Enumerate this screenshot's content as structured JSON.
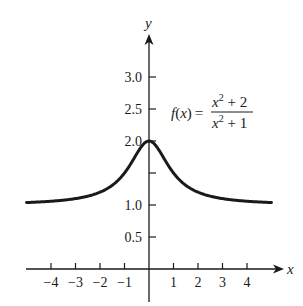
{
  "chart_data": {
    "type": "line",
    "title": "",
    "xlabel": "x",
    "ylabel": "y",
    "xlim": [
      -5,
      5
    ],
    "ylim": [
      0,
      3.4
    ],
    "grid": false,
    "legend": null,
    "x_ticks": [
      -4,
      -3,
      -2,
      -1,
      1,
      2,
      3,
      4
    ],
    "x_tick_labels": [
      "−4",
      "−3",
      "−2",
      "−1",
      "1",
      "2",
      "3",
      "4"
    ],
    "y_ticks": [
      0.5,
      1.0,
      1.5,
      2.0,
      2.5,
      3.0
    ],
    "y_tick_labels": [
      "0.5",
      "1.0",
      "",
      "2.0",
      "2.5",
      "3.0"
    ],
    "annotation": {
      "lhs": "f(x) =",
      "numerator": "x² + 2",
      "denominator": "x² + 1",
      "text": "f(x) = (x^2 + 2)/(x^2 + 1)"
    },
    "series": [
      {
        "name": "f(x) = (x^2+2)/(x^2+1)",
        "x": [
          -5,
          -4.5,
          -4,
          -3.5,
          -3,
          -2.5,
          -2,
          -1.5,
          -1.25,
          -1,
          -0.75,
          -0.5,
          -0.25,
          0,
          0.25,
          0.5,
          0.75,
          1,
          1.25,
          1.5,
          2,
          2.5,
          3,
          3.5,
          4,
          4.5,
          5
        ],
        "y": [
          1.038,
          1.047,
          1.059,
          1.075,
          1.1,
          1.138,
          1.2,
          1.308,
          1.39,
          1.5,
          1.64,
          1.8,
          1.941,
          2.0,
          1.941,
          1.8,
          1.64,
          1.5,
          1.39,
          1.308,
          1.2,
          1.138,
          1.1,
          1.075,
          1.059,
          1.047,
          1.038
        ]
      }
    ]
  },
  "axes": {
    "x_label": "x",
    "y_label": "y"
  },
  "formula": {
    "lhs_f": "f",
    "lhs_paren_open": "(",
    "lhs_x": "x",
    "lhs_paren_close": ")",
    "equals": "=",
    "num_x": "x",
    "num_exp": "2",
    "num_rest": " + 2",
    "den_x": "x",
    "den_exp": "2",
    "den_rest": " + 1"
  },
  "colors": {
    "ink": "#1a1a1a",
    "background": "#ffffff"
  }
}
